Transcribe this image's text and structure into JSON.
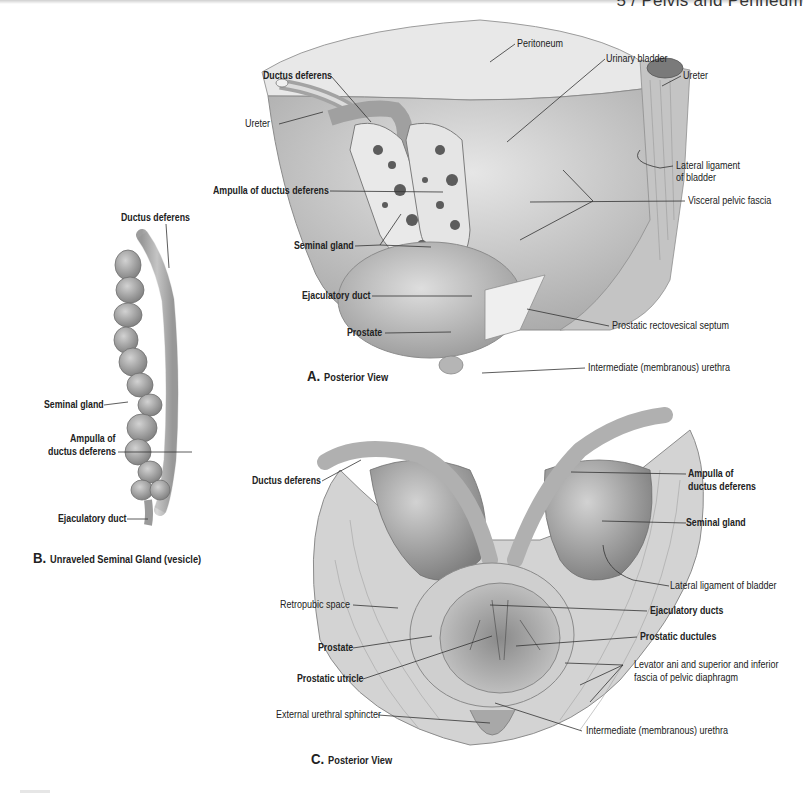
{
  "header": {
    "title": "5 / Pelvis and Perineum"
  },
  "figure_a": {
    "caption_letter": "A.",
    "caption_text": "Posterior View",
    "labels": {
      "peritoneum": "Peritoneum",
      "urinary_bladder": "Urinary bladder",
      "ureter_right": "Ureter",
      "ductus_deferens": "Ductus deferens",
      "ureter_left": "Ureter",
      "lateral_ligament_1": "Lateral ligament",
      "lateral_ligament_2": "of bladder",
      "ampulla": "Ampulla of ductus deferens",
      "visceral_pelvic_fascia": "Visceral pelvic fascia",
      "seminal_gland": "Seminal gland",
      "ejaculatory_duct": "Ejaculatory duct",
      "prostate": "Prostate",
      "prostatic_rectovesical_septum": "Prostatic rectovesical septum",
      "intermediate_urethra": "Intermediate (membranous) urethra"
    }
  },
  "figure_b": {
    "caption_letter": "B.",
    "caption_text": "Unraveled Seminal Gland (vesicle)",
    "labels": {
      "ductus_deferens": "Ductus deferens",
      "seminal_gland": "Seminal gland",
      "ampulla_1": "Ampulla of",
      "ampulla_2": "ductus deferens",
      "ejaculatory_duct": "Ejaculatory duct"
    }
  },
  "figure_c": {
    "caption_letter": "C.",
    "caption_text": "Posterior View",
    "labels": {
      "ductus_deferens": "Ductus deferens",
      "ampulla_1": "Ampulla of",
      "ampulla_2": "ductus deferens",
      "seminal_gland": "Seminal gland",
      "lateral_ligament": "Lateral ligament of bladder",
      "retropubic_space": "Retropubic space",
      "ejaculatory_ducts": "Ejaculatory ducts",
      "prostatic_ductules": "Prostatic ductules",
      "prostate": "Prostate",
      "levator_ani_1": "Levator ani and superior and inferior",
      "levator_ani_2": "fascia of pelvic diaphragm",
      "prostatic_utricle": "Prostatic utricle",
      "external_urethral_sphincter": "External urethral sphincter",
      "intermediate_urethra": "Intermediate (membranous) urethra"
    }
  }
}
